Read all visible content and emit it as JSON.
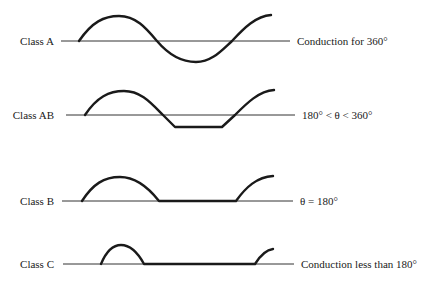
{
  "rows": [
    {
      "class_label": "Class A",
      "condition": "Conduction for 360°",
      "conduction_degrees": "360"
    },
    {
      "class_label": "Class AB",
      "condition": "180° < θ < 360°",
      "conduction_degrees": "between 180 and 360"
    },
    {
      "class_label": "Class B",
      "condition": "θ = 180°",
      "conduction_degrees": "180"
    },
    {
      "class_label": "Class C",
      "condition": "Conduction less than 180°",
      "conduction_degrees": "less than 180"
    }
  ],
  "colors": {
    "waveform": "#1a1a1a",
    "baseline": "#333333",
    "background": "#ffffff"
  }
}
